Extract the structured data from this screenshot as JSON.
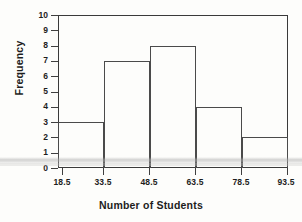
{
  "chart_data": {
    "type": "bar",
    "title": "",
    "subtitle": "",
    "xlabel": "Number of Students",
    "ylabel": "Frequency",
    "categories": [
      "18.5-33.5",
      "33.5-48.5",
      "48.5-63.5",
      "63.5-78.5",
      "78.5-93.5"
    ],
    "values": [
      3,
      7,
      8,
      4,
      2
    ],
    "bin_edges": [
      18.5,
      33.5,
      48.5,
      63.5,
      78.5,
      93.5
    ],
    "x_tick_labels": [
      "18.5",
      "33.5",
      "48.5",
      "63.5",
      "78.5",
      "93.5"
    ],
    "y_tick_labels": [
      "0",
      "1",
      "2",
      "3",
      "4",
      "5",
      "6",
      "7",
      "8",
      "9",
      "10"
    ],
    "y_ticks": [
      0,
      1,
      2,
      3,
      4,
      5,
      6,
      7,
      8,
      9,
      10
    ],
    "xlim": [
      18.5,
      93.5
    ],
    "ylim": [
      0,
      10
    ],
    "grid": false,
    "legend": false,
    "legend_position": "none",
    "bar_fill_color": "#ffffff",
    "bar_edge_color": "#4a4a4a",
    "frame_color": "#3a3a3a",
    "text_color": "#1d1d1d",
    "background_color": "#fdfdfb",
    "annotations": []
  }
}
